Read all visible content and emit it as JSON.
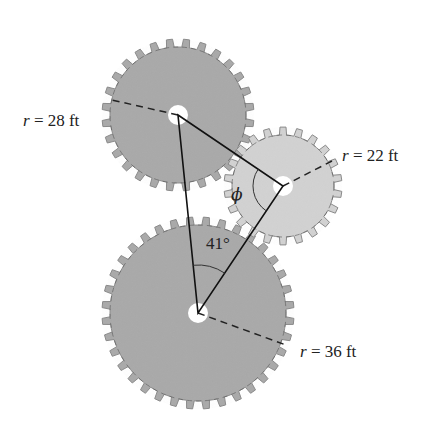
{
  "diagram": {
    "type": "gear-triangle",
    "gears": [
      {
        "id": "gear-top-left",
        "radius_label": "r = 28 ft",
        "var": "r",
        "eq": "=",
        "value": "28 ft",
        "center": [
          178,
          115
        ],
        "px_radius": 72,
        "teeth": 28,
        "fill": "#a9a9a9",
        "radius_end": [
          112,
          100
        ]
      },
      {
        "id": "gear-right",
        "radius_label": "r = 22 ft",
        "var": "r",
        "eq": "=",
        "value": "22 ft",
        "center": [
          283,
          186
        ],
        "px_radius": 55,
        "teeth": 22,
        "fill": "#d2d2d2",
        "radius_end": [
          334,
          160
        ]
      },
      {
        "id": "gear-bottom",
        "radius_label": "r = 36 ft",
        "var": "r",
        "eq": "=",
        "value": "36 ft",
        "center": [
          198,
          313
        ],
        "px_radius": 92,
        "teeth": 36,
        "fill": "#a9a9a9",
        "radius_end": [
          286,
          345
        ]
      }
    ],
    "angles": {
      "phi": {
        "symbol": "ϕ",
        "vertex": "gear-right"
      },
      "known": {
        "text": "41°",
        "vertex": "gear-bottom"
      }
    },
    "colors": {
      "line": "#111111",
      "dark_gear": "#a9a9a9",
      "light_gear": "#d2d2d2",
      "tooth_edge": "#8a8a8a",
      "hub": "#ffffff"
    }
  },
  "labels": {
    "r28": {
      "var": "r",
      "rest": " = 28 ft"
    },
    "r22": {
      "var": "r",
      "rest": " = 22 ft"
    },
    "r36": {
      "var": "r",
      "rest": " = 36 ft"
    },
    "phi": "ϕ",
    "angle41": "41°"
  }
}
